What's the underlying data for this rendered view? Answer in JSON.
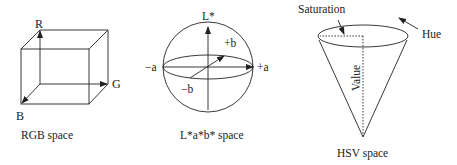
{
  "diagram": {
    "rgb": {
      "axis_r": "R",
      "axis_g": "G",
      "axis_b": "B",
      "caption": "RGB space"
    },
    "lab": {
      "axis_l": "L*",
      "pos_a": "+a",
      "neg_a": "−a",
      "pos_b": "+b",
      "neg_b": "−b",
      "caption": "L*a*b* space"
    },
    "hsv": {
      "saturation": "Saturation",
      "hue": "Hue",
      "value": "Value",
      "caption": "HSV space"
    },
    "colors": {
      "stroke": "#222222",
      "background": "#ffffff"
    }
  }
}
